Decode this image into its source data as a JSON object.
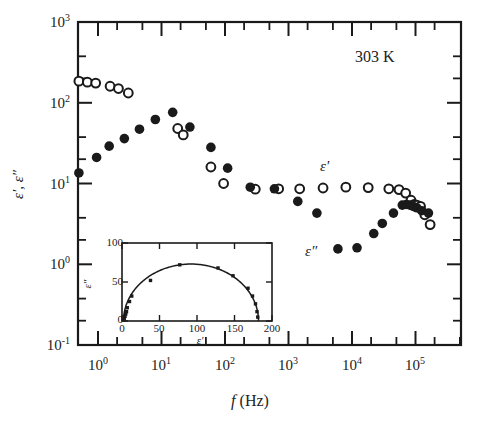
{
  "figure": {
    "annotation": "303 K",
    "xlabel_italic": "f",
    "xlabel_unit": "(Hz)",
    "ylabel": "ε′, ε″",
    "label_eps_real": "ε′",
    "label_eps_imag": "ε″"
  },
  "axes": {
    "x_tick_labels": [
      "10",
      "10",
      "10",
      "10",
      "10",
      "10"
    ],
    "x_tick_exponents": [
      "0",
      "1",
      "2",
      "3",
      "4",
      "5"
    ],
    "y_tick_labels": [
      "10",
      "10",
      "10",
      "10",
      "10"
    ],
    "y_tick_exponents": [
      "3",
      "2",
      "1",
      "0",
      "-1"
    ]
  },
  "inset": {
    "xlabel": "ε′",
    "ylabel": "ε″",
    "x_ticks": [
      "0",
      "50",
      "100",
      "150",
      "200"
    ],
    "y_ticks": [
      "0",
      "50",
      "100"
    ]
  },
  "chart_data": {
    "type": "scatter",
    "title": "",
    "subtitle": "",
    "annotation": "303 K",
    "xlabel": "f (Hz)",
    "ylabel": "ε′, ε″",
    "xscale": "log",
    "yscale": "log",
    "xlim": [
      0.4,
      250000
    ],
    "ylim": [
      0.1,
      1000
    ],
    "x_major_ticks": [
      1,
      10,
      100,
      1000,
      10000,
      100000
    ],
    "y_major_ticks": [
      0.1,
      1,
      10,
      100,
      1000
    ],
    "grid": false,
    "legend": "inline-annotations",
    "series": [
      {
        "name": "ε′",
        "marker": "open-circle",
        "color": "#1a1a1a",
        "points": [
          [
            0.5,
            185
          ],
          [
            0.68,
            180
          ],
          [
            0.92,
            175
          ],
          [
            1.55,
            160
          ],
          [
            2.1,
            150
          ],
          [
            3.0,
            132
          ],
          [
            18,
            48
          ],
          [
            22,
            40
          ],
          [
            60,
            16
          ],
          [
            95,
            10.0
          ],
          [
            300,
            8.5
          ],
          [
            700,
            8.6
          ],
          [
            1500,
            8.6
          ],
          [
            3500,
            8.8
          ],
          [
            8000,
            9.0
          ],
          [
            18000,
            8.9
          ],
          [
            38000,
            8.6
          ],
          [
            55000,
            8.4
          ],
          [
            70000,
            7.6
          ],
          [
            85000,
            6.2
          ],
          [
            95000,
            5.5
          ],
          [
            105000,
            5.4
          ],
          [
            120000,
            5.2
          ],
          [
            140000,
            4.1
          ],
          [
            170000,
            3.1
          ]
        ]
      },
      {
        "name": "ε″",
        "marker": "filled-circle",
        "color": "#1a1a1a",
        "points": [
          [
            0.5,
            13.5
          ],
          [
            0.95,
            21
          ],
          [
            1.5,
            29
          ],
          [
            2.6,
            36
          ],
          [
            4.5,
            47
          ],
          [
            8.0,
            62
          ],
          [
            15,
            76
          ],
          [
            28,
            50
          ],
          [
            60,
            28
          ],
          [
            110,
            15.5
          ],
          [
            250,
            9.0
          ],
          [
            600,
            8.6
          ],
          [
            1400,
            6.0
          ],
          [
            2800,
            4.3
          ],
          [
            6000,
            1.55
          ],
          [
            12000,
            1.6
          ],
          [
            22000,
            2.4
          ],
          [
            30000,
            3.2
          ],
          [
            45000,
            4.3
          ],
          [
            62000,
            5.4
          ],
          [
            72000,
            5.5
          ],
          [
            82000,
            5.4
          ],
          [
            92000,
            5.2
          ],
          [
            105000,
            5.0
          ],
          [
            125000,
            4.6
          ],
          [
            160000,
            4.3
          ]
        ]
      }
    ],
    "inset_chart": {
      "type": "scatter",
      "title": "",
      "xlabel": "ε′",
      "ylabel": "ε″",
      "xlim": [
        0,
        200
      ],
      "ylim": [
        0,
        100
      ],
      "x_ticks": [
        0,
        50,
        100,
        150,
        200
      ],
      "y_ticks": [
        0,
        50,
        100
      ],
      "grid": false,
      "marker": "small-filled-square",
      "fit_curve": "cole-cole-arc",
      "points": [
        [
          3,
          3
        ],
        [
          4,
          6
        ],
        [
          5,
          9
        ],
        [
          6,
          12
        ],
        [
          7,
          17
        ],
        [
          10,
          25
        ],
        [
          13,
          32
        ],
        [
          38,
          52
        ],
        [
          77,
          72
        ],
        [
          128,
          68
        ],
        [
          148,
          58
        ],
        [
          168,
          42
        ],
        [
          174,
          32
        ],
        [
          178,
          22
        ],
        [
          180,
          12
        ],
        [
          181,
          5
        ]
      ],
      "fit": {
        "description": "depressed semicircle through ε″ vs ε′",
        "eps_inf": 2,
        "eps_static": 182,
        "peak_eps_imag": 73
      }
    }
  }
}
